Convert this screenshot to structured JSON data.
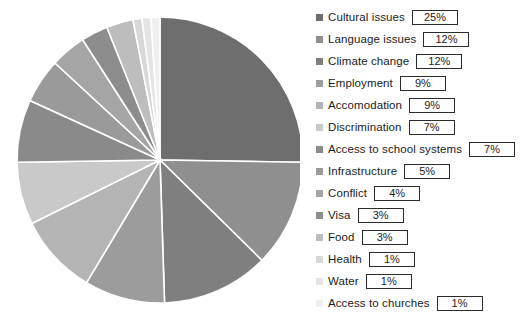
{
  "chart_data": {
    "type": "pie",
    "title": "",
    "legend_position": "right",
    "start_angle_clock": "12 o'clock",
    "direction": "clockwise",
    "units": "percent",
    "categories": [
      "Cultural issues",
      "Language issues",
      "Climate change",
      "Employment",
      "Accomodation",
      "Discrimination",
      "Access to school systems",
      "Infrastructure",
      "Conflict",
      "Visa",
      "Food",
      "Health",
      "Water",
      "Access to churches"
    ],
    "values": [
      25,
      12,
      12,
      9,
      9,
      7,
      7,
      5,
      4,
      3,
      3,
      1,
      1,
      1
    ],
    "value_labels": [
      "25%",
      "12%",
      "12%",
      "9%",
      "9%",
      "7%",
      "7%",
      "5%",
      "4%",
      "3%",
      "3%",
      "1%",
      "1%",
      "1%"
    ],
    "colors": [
      "#6e6e6e",
      "#8f8f8f",
      "#7f7f7f",
      "#9c9c9c",
      "#b4b4b4",
      "#c9c9c9",
      "#8a8a8a",
      "#9a9a9a",
      "#a5a5a5",
      "#8d8d8d",
      "#bdbdbd",
      "#d8d8d8",
      "#e4e4e4",
      "#efefef"
    ],
    "slice_border_color": "#ffffff"
  },
  "legend": {
    "items": [
      {
        "label": "Cultural issues",
        "value": "25%",
        "swatch": "#6e6e6e"
      },
      {
        "label": "Language issues",
        "value": "12%",
        "swatch": "#8f8f8f"
      },
      {
        "label": "Climate change",
        "value": "12%",
        "swatch": "#7f7f7f"
      },
      {
        "label": "Employment",
        "value": "9%",
        "swatch": "#9c9c9c"
      },
      {
        "label": "Accomodation",
        "value": "9%",
        "swatch": "#b4b4b4"
      },
      {
        "label": "Discrimination",
        "value": "7%",
        "swatch": "#c9c9c9"
      },
      {
        "label": "Access to school systems",
        "value": "7%",
        "swatch": "#8a8a8a"
      },
      {
        "label": "Infrastructure",
        "value": "5%",
        "swatch": "#9a9a9a"
      },
      {
        "label": "Conflict",
        "value": "4%",
        "swatch": "#a5a5a5"
      },
      {
        "label": "Visa",
        "value": "3%",
        "swatch": "#8d8d8d"
      },
      {
        "label": "Food",
        "value": "3%",
        "swatch": "#bdbdbd"
      },
      {
        "label": "Health",
        "value": "1%",
        "swatch": "#d8d8d8"
      },
      {
        "label": "Water",
        "value": "1%",
        "swatch": "#e4e4e4"
      },
      {
        "label": "Access to churches",
        "value": "1%",
        "swatch": "#efefef"
      }
    ]
  }
}
